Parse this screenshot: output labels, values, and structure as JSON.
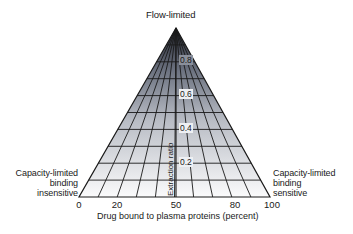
{
  "diagram": {
    "title": "Flow-limited",
    "left_label": [
      "Capacity-limited",
      "binding",
      "insensitive"
    ],
    "right_label": [
      "Capacity-limited",
      "binding",
      "sensitive"
    ],
    "x_axis": {
      "label": "Drug bound to plasma proteins (percent)",
      "ticks": [
        "0",
        "20",
        "50",
        "80",
        "100"
      ],
      "range": [
        0,
        100
      ]
    },
    "y_axis": {
      "label": "Extraction ratio",
      "ticks": [
        "0.2",
        "0.4",
        "0.6",
        "0.8"
      ],
      "range": [
        0,
        1
      ]
    },
    "grid": {
      "base_divisions_percent": [
        10,
        20,
        30,
        40,
        50,
        60,
        70,
        80,
        90
      ],
      "horizontal_levels": [
        0.1,
        0.2,
        0.3,
        0.4,
        0.5,
        0.6,
        0.7,
        0.8,
        0.9
      ]
    },
    "colors": {
      "line": "#1a1a1a",
      "fill_top": "#2b2f3a",
      "fill_bottom": "#ffffff"
    }
  }
}
